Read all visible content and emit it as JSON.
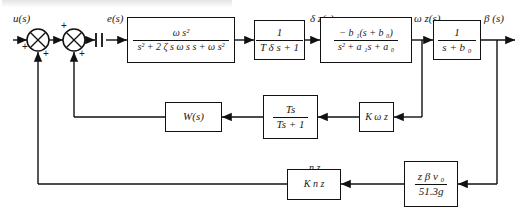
{
  "diagram": {
    "signals": {
      "input": "u(s)",
      "error": "e(s)",
      "delta_z": "δ z(s)",
      "omega_z": "ω z(s)",
      "beta": "β (s)",
      "n_z": "n z"
    },
    "sum_signs": {
      "j1_in": "+",
      "j1_fb": "+",
      "j2_in": "+",
      "j2_fb": "+"
    },
    "blocks": [
      {
        "id": "actuator-second-order",
        "numerator": "ω s²",
        "denominator": "s² + 2 ζ s ω s s + ω s²"
      },
      {
        "id": "servo-lag",
        "numerator": "1",
        "denominator": "T δ s + 1"
      },
      {
        "id": "airframe-rate",
        "numerator": "− b ₁(s + b ₀)",
        "denominator": "s² + a ₁s + a ₀"
      },
      {
        "id": "beta-integrator",
        "numerator": "1",
        "denominator": "s + b ₀"
      },
      {
        "id": "washout-filter",
        "numerator": "Ts",
        "denominator": "Ts + 1"
      },
      {
        "id": "shaping-filter",
        "label": "W(s)"
      },
      {
        "id": "rate-gain",
        "label": "K ω z"
      },
      {
        "id": "accel-gain",
        "label": "K n z"
      },
      {
        "id": "accel-sensor",
        "numerator": "z β v ₀",
        "denominator": "51.3g"
      }
    ]
  }
}
